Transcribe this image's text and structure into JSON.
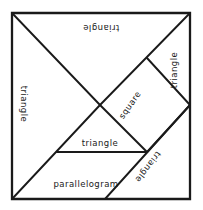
{
  "figure": {
    "name": "tangram-dissection-diagram",
    "ink_color": "#1a1a1a",
    "background_color": "#ffffff",
    "frame": {
      "left": 12,
      "top": 13,
      "right": 190,
      "bottom": 199
    }
  },
  "labels": [
    {
      "id": "label-triangle-top",
      "text": "triangle",
      "x": 101,
      "y": 28,
      "rotation": 180
    },
    {
      "id": "label-triangle-right",
      "text": "triangle",
      "x": 174,
      "y": 70,
      "rotation": -90
    },
    {
      "id": "label-triangle-left",
      "text": "triangle",
      "x": 24,
      "y": 104,
      "rotation": 90
    },
    {
      "id": "label-square",
      "text": "square",
      "x": 130,
      "y": 105,
      "rotation": -55
    },
    {
      "id": "label-triangle-center",
      "text": "triangle",
      "x": 100,
      "y": 143,
      "rotation": 0
    },
    {
      "id": "label-triangle-lower-right",
      "text": "triangle",
      "x": 148,
      "y": 167,
      "rotation": 127
    },
    {
      "id": "label-parallelogram",
      "text": "parallelogram",
      "x": 86,
      "y": 184,
      "rotation": 0
    }
  ],
  "shapes": {
    "outer_square": "12,13 190,13 190,199 12,199",
    "edges": [
      "M 12,13 L 100,105",
      "M 190,13 L 100,105",
      "M 147,58 L 190,105",
      "M 100,105 L 147,152",
      "M 190,105 L 147,152",
      "M 57,152 L 147,152",
      "M 12,199 L 100,105",
      "M 105,199 L 190,105"
    ]
  }
}
